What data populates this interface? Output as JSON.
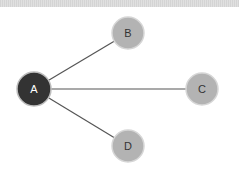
{
  "diagram": {
    "type": "star-graph",
    "nodes": [
      {
        "id": "A",
        "label": "A",
        "cx": 34,
        "cy": 89,
        "r": 17,
        "fill": "#333333",
        "stroke": "#bdbdbd",
        "text_color": "#ffffff"
      },
      {
        "id": "B",
        "label": "B",
        "cx": 128,
        "cy": 33,
        "r": 16,
        "fill": "#b3b3b3",
        "stroke": "#d6d6d6",
        "text_color": "#333333"
      },
      {
        "id": "C",
        "label": "C",
        "cx": 202,
        "cy": 89,
        "r": 16,
        "fill": "#b3b3b3",
        "stroke": "#d6d6d6",
        "text_color": "#333333"
      },
      {
        "id": "D",
        "label": "D",
        "cx": 128,
        "cy": 146,
        "r": 16,
        "fill": "#b3b3b3",
        "stroke": "#d6d6d6",
        "text_color": "#333333"
      }
    ],
    "edges": [
      {
        "from": "A",
        "to": "B"
      },
      {
        "from": "A",
        "to": "C"
      },
      {
        "from": "A",
        "to": "D"
      }
    ],
    "edge_color": "#555555"
  }
}
